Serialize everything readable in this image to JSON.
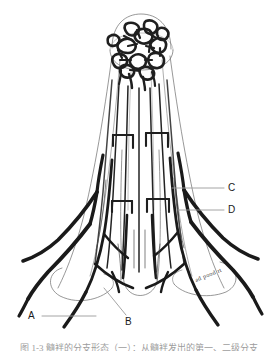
{
  "figure": {
    "background_color": "#ffffff",
    "ink_color": "#1a1a1a",
    "outline_color": "#555555",
    "leader_color": "#8a8a8a",
    "width": 278,
    "height": 351
  },
  "labels": [
    {
      "id": "A",
      "text": "A",
      "leader": "horizontal"
    },
    {
      "id": "B",
      "text": "B",
      "leader": "diagonal"
    },
    {
      "id": "C",
      "text": "C",
      "leader": "horizontal"
    },
    {
      "id": "D",
      "text": "D",
      "leader": "horizontal"
    }
  ],
  "caption": {
    "text": "图 1-3  髓袢的分支形态（一）：从髓袢发出的第一、二级分支",
    "note": "clipped at bottom edge of image"
  },
  "signature": {
    "text": "ad pood rt"
  }
}
